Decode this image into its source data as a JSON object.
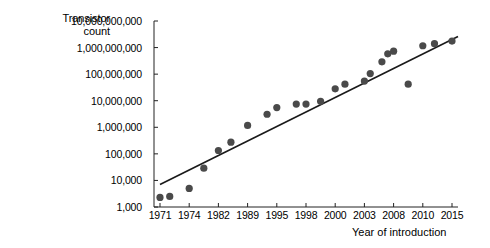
{
  "chart_data": {
    "type": "scatter",
    "title": "",
    "xlabel": "Year of introduction",
    "ylabel": "Transistor count",
    "ylabel_lines": [
      "Transistor",
      "count"
    ],
    "yscale": "log",
    "ylim": [
      1000,
      10000000000
    ],
    "grid": false,
    "legend": null,
    "ytick_labels": [
      "10,000,000,000",
      "1,000,000,000",
      "100,000,000",
      "10,000,000",
      "1,000,000",
      "100,000",
      "10,000",
      "1,000"
    ],
    "ytick_values": [
      10000000000,
      1000000000,
      100000000,
      10000000,
      1000000,
      100000,
      10000,
      1000
    ],
    "xtick_labels": [
      "1971",
      "1974",
      "1982",
      "1989",
      "1995",
      "1998",
      "2000",
      "2003",
      "2008",
      "2010",
      "2015"
    ],
    "x": [
      1971,
      1972,
      1974,
      1978,
      1982,
      1985,
      1989,
      1993,
      1995,
      1997,
      1998,
      1999,
      2000,
      2001,
      2003,
      2004,
      2006,
      2007,
      2008,
      2009,
      2010,
      2012,
      2015
    ],
    "y": [
      2300,
      2500,
      5000,
      29000,
      134000,
      275000,
      1180000,
      3100000,
      5500000,
      7500000,
      7500000,
      9500000,
      28000000,
      42000000,
      55000000,
      105000000,
      291000000,
      582000000,
      731000000,
      42000000,
      1170000000,
      1400000000,
      1750000000
    ],
    "series": [
      {
        "name": "Transistor count",
        "marker": "circle",
        "color": "#4a4a4a",
        "points": [
          {
            "x": 1971,
            "y": 2300
          },
          {
            "x": 1972,
            "y": 2500
          },
          {
            "x": 1974,
            "y": 5000
          },
          {
            "x": 1978,
            "y": 29000
          },
          {
            "x": 1982,
            "y": 134000
          },
          {
            "x": 1985,
            "y": 275000
          },
          {
            "x": 1989,
            "y": 1180000
          },
          {
            "x": 1993,
            "y": 3100000
          },
          {
            "x": 1995,
            "y": 5500000
          },
          {
            "x": 1997,
            "y": 7500000
          },
          {
            "x": 1998,
            "y": 7500000
          },
          {
            "x": 1999,
            "y": 9500000
          },
          {
            "x": 2000,
            "y": 28000000
          },
          {
            "x": 2001,
            "y": 42000000
          },
          {
            "x": 2003,
            "y": 55000000
          },
          {
            "x": 2004,
            "y": 105000000
          },
          {
            "x": 2006,
            "y": 291000000
          },
          {
            "x": 2007,
            "y": 582000000
          },
          {
            "x": 2008,
            "y": 731000000
          },
          {
            "x": 2009,
            "y": 42000000
          },
          {
            "x": 2010,
            "y": 1170000000
          },
          {
            "x": 2012,
            "y": 1400000000
          },
          {
            "x": 2015,
            "y": 1750000000
          }
        ]
      }
    ],
    "trendline": {
      "name": "linear fit",
      "color": "#1a1a1a",
      "start": {
        "x": 1971,
        "y": 7000
      },
      "end": {
        "x": 2015,
        "y": 2600000000
      }
    }
  }
}
